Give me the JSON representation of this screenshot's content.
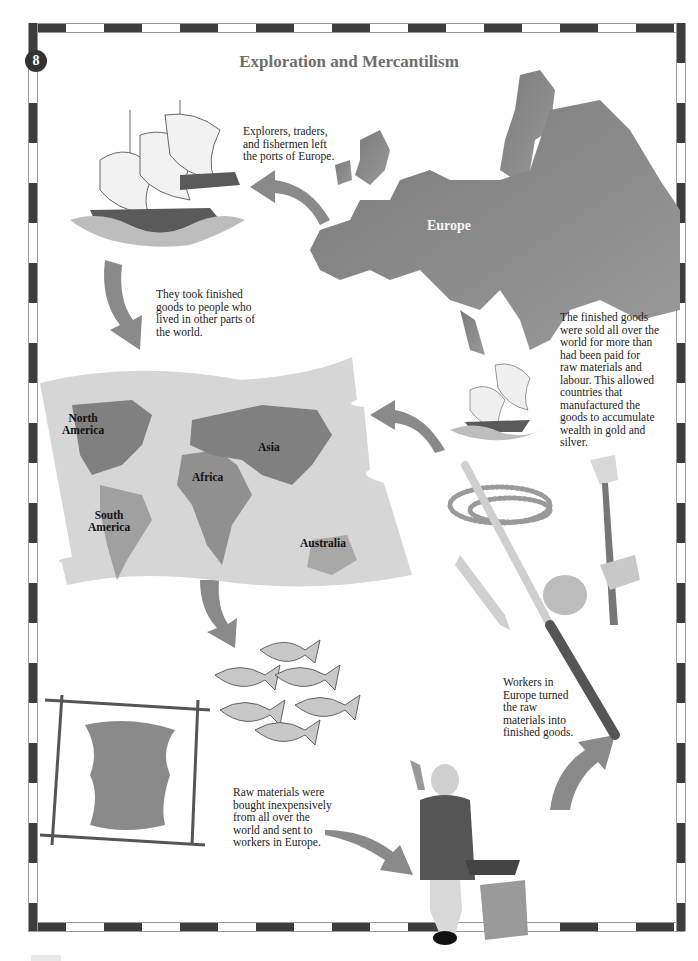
{
  "page": {
    "number": "8",
    "title": "Exploration and Mercantilism",
    "colors": {
      "border_dark": "#3d3d3d",
      "title_gray": "#6e6e6e",
      "landmass_gray": "#808080",
      "map_paper": "#d6d6d6"
    }
  },
  "captions": {
    "explorers": "Explorers, traders, and fishermen left the ports of Europe.",
    "finished_goods_out": "They took finished goods to people who lived in other parts of the world.",
    "sold_worldwide": "The finished goods were sold all over the world for more than had been paid for raw materials and labour. This allowed countries that manufactured the goods to accumulate wealth in gold and silver.",
    "workers": "Workers in Europe turned the raw materials into finished goods.",
    "raw_materials": "Raw materials were bought inexpensively from all over the world and sent to workers in Europe."
  },
  "map_labels": {
    "europe": "Europe",
    "north_america_1": "North",
    "north_america_2": "America",
    "south_america_1": "South",
    "south_america_2": "America",
    "africa": "Africa",
    "asia": "Asia",
    "australia": "Australia"
  },
  "illustrations": [
    "ships-sailing-from-europe",
    "europe-map",
    "world-map-parchment",
    "small-ships",
    "trade-goods: beads, sword, axe, kettle, pot, knife, musket",
    "school-of-fish",
    "stretched-animal-hide",
    "blacksmith-worker-with-anvil"
  ]
}
